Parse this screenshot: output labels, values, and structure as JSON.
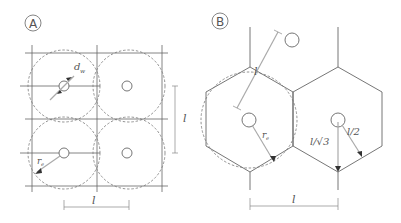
{
  "panels": {
    "a": {
      "label": "A",
      "d_label": "d",
      "d_sub": "w",
      "r_label": "r",
      "r_sub": "e",
      "spacing_h": "l",
      "spacing_v": "l"
    },
    "b": {
      "label": "B",
      "spacing_diag": "l",
      "r_label": "r",
      "r_sub": "e",
      "l_sqrt3": "l/√3",
      "l_half": "l/2",
      "spacing_h": "l"
    }
  }
}
